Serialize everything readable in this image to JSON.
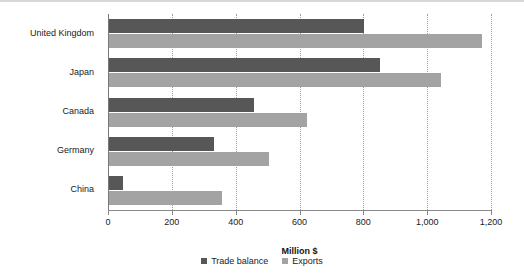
{
  "chart_data": {
    "type": "bar",
    "orientation": "horizontal",
    "title": "",
    "xlabel": "Million $",
    "ylabel": "",
    "xlim": [
      0,
      1200
    ],
    "xticks": [
      0,
      200,
      400,
      600,
      800,
      1000,
      1200
    ],
    "xtick_labels": [
      "0",
      "200",
      "400",
      "600",
      "800",
      "1,000",
      "1,200"
    ],
    "grid": true,
    "legend_position": "bottom",
    "categories": [
      "United Kingdom",
      "Japan",
      "Canada",
      "Germany",
      "China"
    ],
    "series": [
      {
        "name": "Trade balance",
        "color": "#575757",
        "values": [
          800,
          850,
          455,
          330,
          45
        ]
      },
      {
        "name": "Exports",
        "color": "#a3a3a3",
        "values": [
          1170,
          1040,
          620,
          500,
          355
        ]
      }
    ]
  },
  "legend": {
    "items": [
      {
        "label": "Trade balance",
        "swatch": "legend-swatch-trade-balance"
      },
      {
        "label": "Exports",
        "swatch": "legend-swatch-exports"
      }
    ]
  }
}
